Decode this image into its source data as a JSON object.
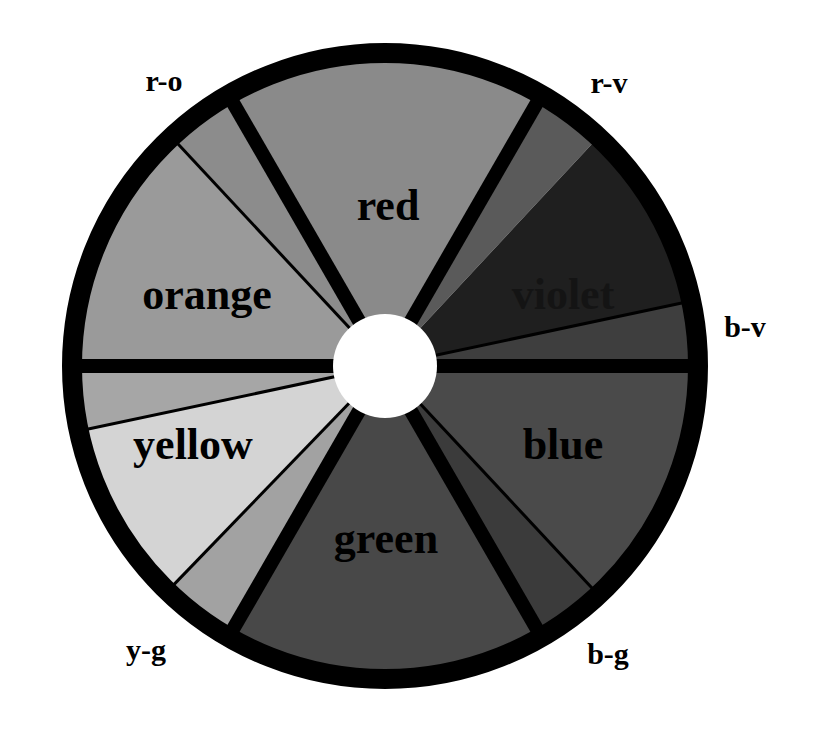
{
  "diagram": {
    "type": "color-wheel",
    "center": {
      "x": 385,
      "y": 366
    },
    "outer_radius": 323,
    "rim_width": 20,
    "hub_radius": 52,
    "colors": {
      "rim": "#000000",
      "hub": "#ffffff",
      "background": "#ffffff"
    },
    "segments": [
      {
        "id": "red",
        "start": -30,
        "end": 30,
        "fill": "#8a8a8a"
      },
      {
        "id": "r-v",
        "start": 30,
        "end": 43,
        "fill": "#5a5a5a"
      },
      {
        "id": "violet",
        "start": 43,
        "end": 78,
        "fill": "#1f1f1f"
      },
      {
        "id": "b-v",
        "start": 78,
        "end": 90,
        "fill": "#3e3e3e"
      },
      {
        "id": "blue",
        "start": 90,
        "end": 137,
        "fill": "#4a4a4a"
      },
      {
        "id": "b-g",
        "start": 137,
        "end": 150,
        "fill": "#3b3b3b"
      },
      {
        "id": "green",
        "start": 150,
        "end": 210,
        "fill": "#484848"
      },
      {
        "id": "y-g",
        "start": 210,
        "end": 224,
        "fill": "#a2a2a2"
      },
      {
        "id": "yellow",
        "start": 224,
        "end": 258,
        "fill": "#d4d4d4"
      },
      {
        "id": "y-o",
        "start": 258,
        "end": 270,
        "fill": "#a6a6a6"
      },
      {
        "id": "orange",
        "start": 270,
        "end": 317,
        "fill": "#9a9a9a"
      },
      {
        "id": "r-o",
        "start": 317,
        "end": 330,
        "fill": "#8c8c8c"
      }
    ],
    "thick_dividers": [
      -30,
      30,
      90,
      150,
      210,
      270
    ],
    "thin_dividers": [
      78,
      137,
      224,
      258,
      317
    ]
  },
  "labels": {
    "inner": {
      "red": "red",
      "orange": "orange",
      "violet": "violet",
      "yellow": "yellow",
      "blue": "blue",
      "green": "green"
    },
    "outer": {
      "r_o": "r-o",
      "r_v": "r-v",
      "b_v": "b-v",
      "y_g": "y-g",
      "b_g": "b-g"
    }
  }
}
